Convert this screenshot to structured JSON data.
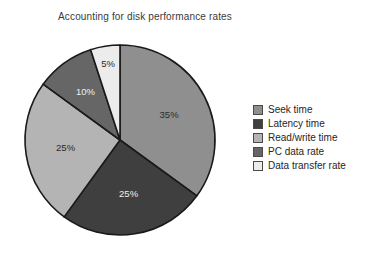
{
  "chart_data": {
    "type": "pie",
    "title": "Accounting for disk performance rates",
    "xlabel": "",
    "ylabel": "",
    "legend_position": "right",
    "grid": false,
    "start_angle_deg": 0,
    "direction": "clockwise",
    "categories": [
      "Seek time",
      "Latency time",
      "Read/write time",
      "PC data rate",
      "Data transfer rate"
    ],
    "values": [
      35,
      25,
      25,
      10,
      5
    ],
    "value_labels": [
      "35%",
      "25%",
      "25%",
      "10%",
      "5%"
    ],
    "unit": "%",
    "total": 100,
    "colors": [
      "#8f8f8f",
      "#3f3f3f",
      "#b4b4b4",
      "#666666",
      "#ececec"
    ],
    "slices": [
      {
        "label": "Seek time",
        "value": 35,
        "display": "35%",
        "color": "#8f8f8f",
        "label_fill": "dark"
      },
      {
        "label": "Latency time",
        "value": 25,
        "display": "25%",
        "color": "#3f3f3f",
        "label_fill": "light"
      },
      {
        "label": "Read/write time",
        "value": 25,
        "display": "25%",
        "color": "#b4b4b4",
        "label_fill": "dark"
      },
      {
        "label": "PC data rate",
        "value": 10,
        "display": "10%",
        "color": "#666666",
        "label_fill": "light"
      },
      {
        "label": "Data transfer rate",
        "value": 5,
        "display": "5%",
        "color": "#ececec",
        "label_fill": "dark"
      }
    ]
  },
  "legend": {
    "items": [
      {
        "label": "Seek time",
        "color": "#8f8f8f"
      },
      {
        "label": "Latency time",
        "color": "#3f3f3f"
      },
      {
        "label": "Read/write time",
        "color": "#b4b4b4"
      },
      {
        "label": "PC data rate",
        "color": "#666666"
      },
      {
        "label": "Data transfer rate",
        "color": "#ececec"
      }
    ]
  }
}
